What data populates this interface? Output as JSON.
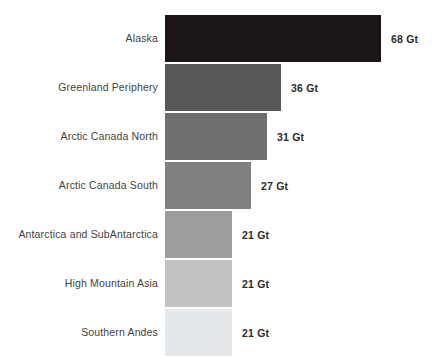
{
  "chart_data": {
    "type": "bar",
    "orientation": "horizontal",
    "title": "",
    "xlabel": "",
    "ylabel": "",
    "unit": "Gt",
    "grid": false,
    "legend": null,
    "xlim": [
      0,
      68
    ],
    "categories": [
      "Alaska",
      "Greenland Periphery",
      "Arctic Canada North",
      "Arctic Canada South",
      "Antarctica and SubAntarctica",
      "High Mountain Asia",
      "Southern Andes"
    ],
    "values": [
      68,
      36,
      31,
      27,
      21,
      21,
      21
    ],
    "value_labels": [
      "68 Gt",
      "36 Gt",
      "31 Gt",
      "27 Gt",
      "21 Gt",
      "21 Gt",
      "21 Gt"
    ],
    "bar_colors": [
      "#1c1517",
      "#575757",
      "#6e6e6e",
      "#808080",
      "#9d9d9d",
      "#c2c2c2",
      "#e4e8ea"
    ],
    "bar_pixel_widths": [
      216,
      116,
      102,
      86,
      67,
      67,
      67
    ],
    "bars": [
      {
        "category": "Alaska",
        "value": 68,
        "label": "68 Gt",
        "color": "#1c1517",
        "width": 216
      },
      {
        "category": "Greenland Periphery",
        "value": 36,
        "label": "36 Gt",
        "color": "#575757",
        "width": 116
      },
      {
        "category": "Arctic Canada North",
        "value": 31,
        "label": "31 Gt",
        "color": "#6e6e6e",
        "width": 102
      },
      {
        "category": "Arctic Canada South",
        "value": 27,
        "label": "27 Gt",
        "color": "#808080",
        "width": 86
      },
      {
        "category": "Antarctica and SubAntarctica",
        "value": 21,
        "label": "21 Gt",
        "color": "#9d9d9d",
        "width": 67
      },
      {
        "category": "High Mountain Asia",
        "value": 21,
        "label": "21 Gt",
        "color": "#c2c2c2",
        "width": 67
      },
      {
        "category": "Southern Andes",
        "value": 21,
        "label": "21 Gt",
        "color": "#e4e8ea",
        "width": 67
      }
    ]
  },
  "canvas": {
    "background": "#ffffff",
    "label_color": "#3f3f3f",
    "value_color": "#2b2b2b"
  }
}
